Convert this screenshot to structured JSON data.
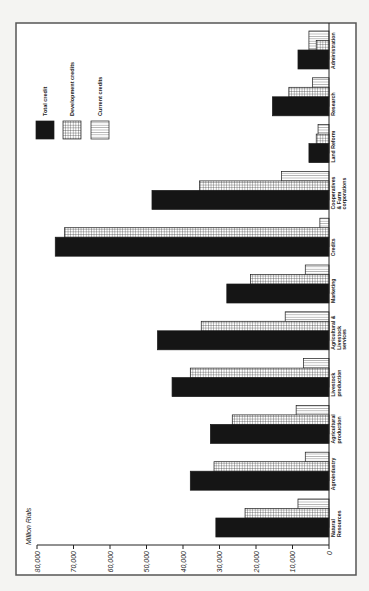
{
  "chart_data": {
    "type": "bar",
    "orientation": "grouped bar chart printed rotated 90° counter-clockwise (value axis runs right-to-left along bottom)",
    "title": "",
    "ylabel": "Million Rials",
    "xlabel": "",
    "ylim": [
      0,
      80000
    ],
    "yticks": [
      0,
      10000,
      20000,
      30000,
      40000,
      50000,
      60000,
      70000,
      80000
    ],
    "ytick_labels": [
      "0",
      "10,000",
      "20,000",
      "30,000",
      "40,000",
      "50,000",
      "60,000",
      "70,000",
      "80,000"
    ],
    "grid": false,
    "legend_position": "upper left (top of page in rotated view)",
    "categories": [
      "Natural Resources",
      "Agroindustry",
      "Agricultural production",
      "Livestock production",
      "Agricultural & Livestock services",
      "Marketing",
      "Credits",
      "Cooperatives & Farm corporations",
      "Land Reform",
      "Research",
      "Administration"
    ],
    "category_label_lines": [
      [
        "Natural",
        "Resources"
      ],
      [
        "Agroindustry"
      ],
      [
        "Agricultural",
        "production"
      ],
      [
        "Livestock",
        "production"
      ],
      [
        "Agricultural &",
        "Livestock",
        "services"
      ],
      [
        "Marketing"
      ],
      [
        "Credits"
      ],
      [
        "Cooperatives",
        "& Farm",
        "corporations"
      ],
      [
        "Land Reform"
      ],
      [
        "Research"
      ],
      [
        "Administration"
      ]
    ],
    "series": [
      {
        "name": "Total credit",
        "pattern": "solid",
        "values": [
          31000,
          38000,
          32500,
          43000,
          47000,
          28000,
          75000,
          48500,
          5500,
          15500,
          8500
        ]
      },
      {
        "name": "Development credits",
        "pattern": "grid",
        "values": [
          23000,
          31500,
          26500,
          38000,
          35000,
          21500,
          72500,
          35500,
          3500,
          11000,
          3500
        ]
      },
      {
        "name": "Current credits",
        "pattern": "vertical-lines",
        "values": [
          8500,
          6500,
          9000,
          7000,
          12000,
          6500,
          2500,
          13000,
          3000,
          4500,
          5500
        ]
      }
    ]
  },
  "colors": {
    "background": "#f4f4f2",
    "plot_bg": "#ffffff",
    "ink": "#1a1a1a"
  }
}
